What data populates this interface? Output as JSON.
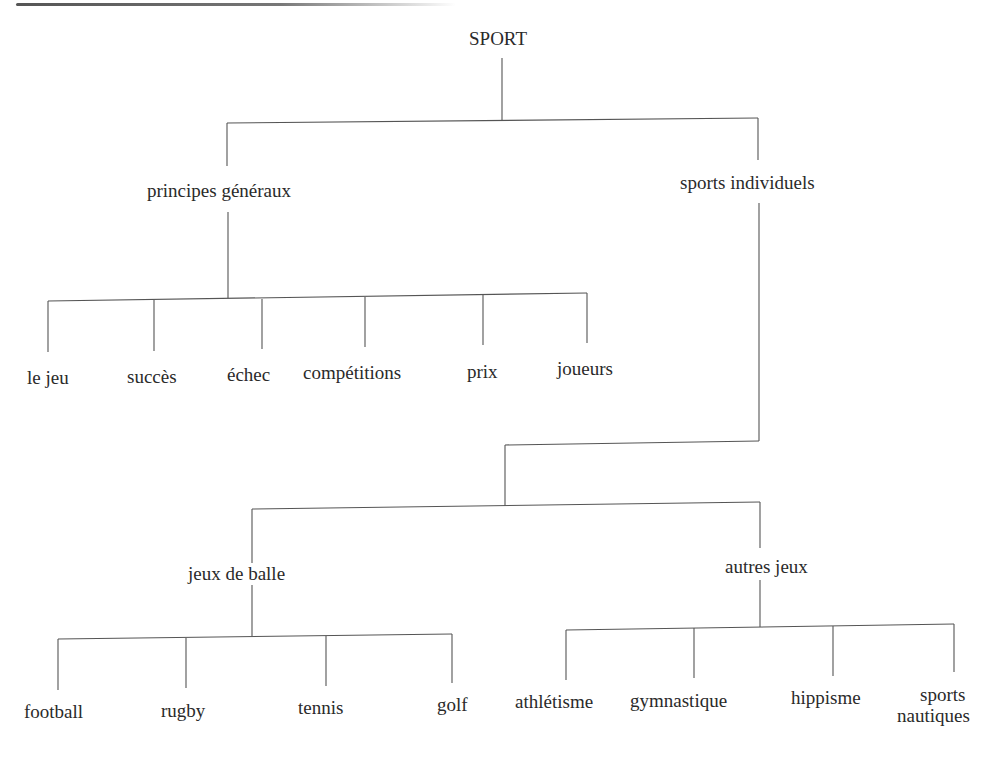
{
  "diagram": {
    "type": "tree",
    "root": "SPORT",
    "nodes": {
      "root": "SPORT",
      "general_principles": "principes généraux",
      "individual_sports": "sports individuels",
      "ball_games": "jeux de balle",
      "other_games": "autres jeux",
      "gp_children": [
        "le jeu",
        "succès",
        "échec",
        "compétitions",
        "prix",
        "joueurs"
      ],
      "ball_children": [
        "football",
        "rugby",
        "tennis",
        "golf"
      ],
      "other_children": [
        "athlétisme",
        "gymnastique",
        "hippisme",
        "sports nautiques"
      ],
      "other_children_last_line1": "sports",
      "other_children_last_line2": "nautiques"
    },
    "edges": [
      [
        "SPORT",
        "principes généraux"
      ],
      [
        "SPORT",
        "sports individuels"
      ],
      [
        "principes généraux",
        "le jeu"
      ],
      [
        "principes généraux",
        "succès"
      ],
      [
        "principes généraux",
        "échec"
      ],
      [
        "principes généraux",
        "compétitions"
      ],
      [
        "principes généraux",
        "prix"
      ],
      [
        "principes généraux",
        "joueurs"
      ],
      [
        "sports individuels",
        "jeux de balle"
      ],
      [
        "sports individuels",
        "autres jeux"
      ],
      [
        "jeux de balle",
        "football"
      ],
      [
        "jeux de balle",
        "rugby"
      ],
      [
        "jeux de balle",
        "tennis"
      ],
      [
        "jeux de balle",
        "golf"
      ],
      [
        "autres jeux",
        "athlétisme"
      ],
      [
        "autres jeux",
        "gymnastique"
      ],
      [
        "autres jeux",
        "hippisme"
      ],
      [
        "autres jeux",
        "sports nautiques"
      ]
    ],
    "line_color": "#555555",
    "text_color": "#2a2a2a"
  }
}
